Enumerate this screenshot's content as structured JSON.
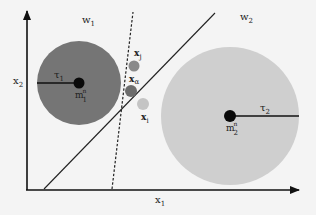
{
  "diagram": {
    "axes": {
      "x_label": "x",
      "x_label_sub": "1",
      "y_label": "x",
      "y_label_sub": "2",
      "color": "#111111"
    },
    "regions": [
      {
        "id": "w1",
        "label": "w",
        "sub": "1"
      },
      {
        "id": "w2",
        "label": "w",
        "sub": "2"
      }
    ],
    "classes": [
      {
        "id": "class1",
        "fill": "#757575",
        "radius_label": "τ",
        "radius_label_sub": "1",
        "center_label": "m",
        "center_label_sub": "1",
        "center_label_sup": "n"
      },
      {
        "id": "class2",
        "fill": "#cfcfcf",
        "radius_label": "τ",
        "radius_label_sub": "2",
        "center_label": "m",
        "center_label_sub": "2",
        "center_label_sup": "n"
      }
    ],
    "points": [
      {
        "id": "xj",
        "label": "x",
        "sub": "j",
        "fill": "#8a8a8a"
      },
      {
        "id": "xa",
        "label": "x",
        "sub": "α",
        "fill": "#6c6c6c"
      },
      {
        "id": "xi",
        "label": "x",
        "sub": "i",
        "fill": "#c4c4c4"
      }
    ],
    "boundaries": [
      {
        "id": "solid-boundary",
        "style": "solid"
      },
      {
        "id": "dashed-boundary",
        "style": "dashed"
      }
    ]
  }
}
